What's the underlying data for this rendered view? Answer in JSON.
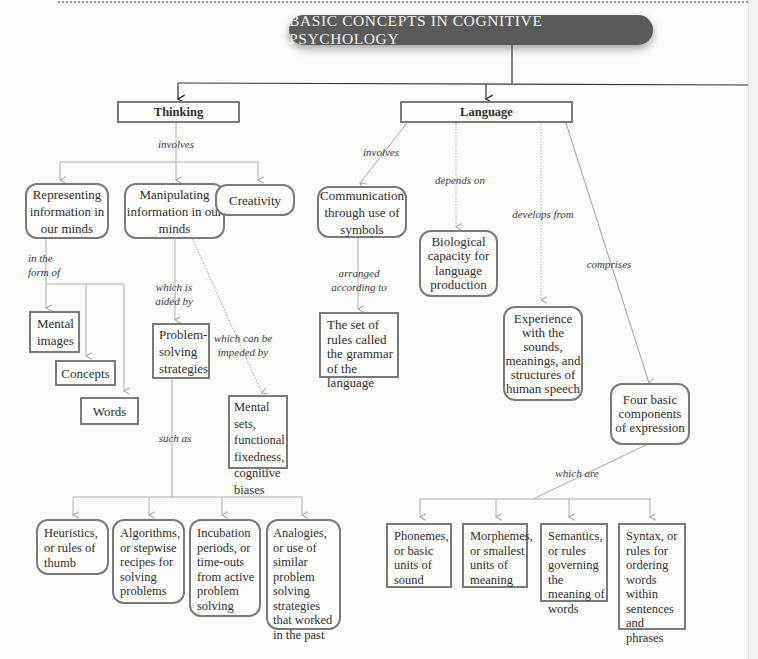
{
  "title": "BASIC CONCEPTS IN COGNITIVE PSYCHOLOGY",
  "colors": {
    "banner_bg": "#5a5a5a",
    "banner_text": "#f4f4f4",
    "box_border": "#7a7a7a",
    "arrow_gray": "#a8a8a8",
    "arrow_dark": "#333333",
    "background": "#fbfbfa"
  },
  "thinking": {
    "label": "Thinking",
    "link_involves": "involves",
    "representing": {
      "label": "Representing information in our minds",
      "link": "in the form of",
      "children": [
        "Mental images",
        "Concepts",
        "Words"
      ]
    },
    "manipulating": {
      "label": "Manipulating information in our minds",
      "link_aided": "which is aided by",
      "link_impeded": "which can be impeded by",
      "problem_solving": "Problem-solving strategies",
      "impediments": "Mental sets, functional fixedness, cognitive biases",
      "link_such_as": "such as",
      "strategies": [
        "Heuristics, or rules of thumb",
        "Algorithms, or stepwise recipes for solving problems",
        "Incubation periods, or time-outs from active problem solving",
        "Analogies, or use of similar problem solving strategies that worked in the past"
      ]
    },
    "creativity": "Creativity"
  },
  "language": {
    "label": "Language",
    "link_involves": "involves",
    "communication": "Communication through use of symbols",
    "link_arranged": "arranged according to",
    "grammar": "The set of rules called the grammar of the language",
    "link_depends": "depends on",
    "biological": "Biological capacity for language production",
    "link_develops": "develops from",
    "experience": "Experience with the sounds, meanings, and structures of human speech",
    "link_comprises": "comprises",
    "four_components": "Four basic components of expression",
    "link_which_are": "which are",
    "components": [
      "Phonemes, or basic units of sound",
      "Morphemes, or smallest units of meaning",
      "Semantics, or rules governing the meaning of words",
      "Syntax, or rules for ordering words within sentences and phrases"
    ]
  }
}
